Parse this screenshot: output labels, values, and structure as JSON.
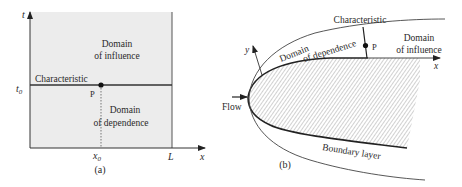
{
  "panel_a": {
    "caption": "(a)",
    "axes": {
      "vertical_label": "t",
      "horizontal_label": "x"
    },
    "ticks": {
      "t0": "t",
      "t0_sub": "0",
      "x0": "x",
      "x0_sub": "0",
      "L": "L"
    },
    "labels": {
      "domain_influence_line1": "Domain",
      "domain_influence_line2": "of influence",
      "domain_dependence_line1": "Domain",
      "domain_dependence_line2": "of dependence",
      "characteristic": "Characteristic",
      "point": "P"
    },
    "colors": {
      "region_fill": "#ececec",
      "line": "#333333"
    }
  },
  "panel_b": {
    "caption": "(b)",
    "axes": {
      "x_label": "x",
      "y_label": "y"
    },
    "labels": {
      "flow": "Flow",
      "characteristic": "Characteristic",
      "domain_dependence_line1": "Domain",
      "domain_dependence_line2": "of dependence",
      "domain_influence_line1": "Domain",
      "domain_influence_line2": "of influence",
      "point": "P",
      "boundary_layer": "Boundary layer"
    },
    "colors": {
      "hatch": "#9a9a9a",
      "line": "#333333"
    }
  }
}
